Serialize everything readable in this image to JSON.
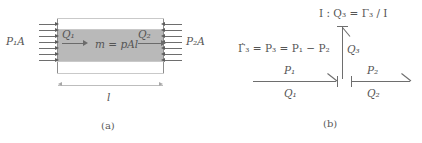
{
  "figure": {
    "panels": [
      {
        "id": "a",
        "caption": "(a)"
      },
      {
        "id": "b",
        "caption": "(b)"
      }
    ]
  },
  "panel_a": {
    "caption": "(a)",
    "left_pressure_label": "P₁A",
    "right_pressure_label": "P₂A",
    "flow_in_label": "Q₁",
    "flow_out_label": "Q₂",
    "mass_equation": "m = pAl",
    "length_label": "l",
    "pressure_arrow_rows": 7,
    "colors": {
      "fluid_fill": "#b9b9b9",
      "wall_line": "#8c8c8c",
      "arrow": "#6b6b6b",
      "text": "#555555"
    }
  },
  "panel_b": {
    "caption": "(b)",
    "inertance_relation": "I : Q₃ = Γ₃ / I",
    "momentum_relation": "Γ̇₃ = P₃ = P₁ − P₂",
    "junction_label": "1",
    "bonds": [
      {
        "name": "left-bond",
        "effort": "P₁",
        "flow": "Q₁"
      },
      {
        "name": "right-bond",
        "effort": "P₂",
        "flow": "Q₂"
      },
      {
        "name": "vertical-bond",
        "effort": "",
        "flow": "Q₃"
      }
    ],
    "labels": {
      "p1": "P₁",
      "q1": "Q₁",
      "p2": "P₂",
      "q2": "Q₂",
      "q3": "Q₃"
    },
    "colors": {
      "bond": "#6e6e6e",
      "text": "#555555"
    }
  }
}
